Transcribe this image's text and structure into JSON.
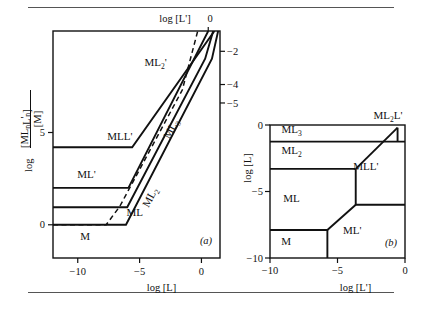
{
  "figure": {
    "panel_a_id": "(a)",
    "panel_b_id": "(b)"
  },
  "chart_data": [
    {
      "type": "line",
      "panel": "(a)",
      "title": "",
      "xlabel": "log [L]",
      "ylabel": "log [ML_nL'_n] / [M]",
      "ylabel_parts": {
        "log": "log",
        "numerator": "[ML",
        "numerator_sub1": "n",
        "numerator_mid": "L",
        "numerator_prime": "'",
        "numerator_sub2": "n",
        "numerator_end": "]",
        "denominator": "[M]"
      },
      "top_axis_label": "log [L']",
      "top_axis_tick": "0",
      "xlim": [
        -12,
        1.5
      ],
      "ylim": [
        -1.8,
        10.5
      ],
      "xticks": [
        -10,
        -5,
        0
      ],
      "xticklabels": [
        "−10",
        "−5",
        "0"
      ],
      "yticks": [
        0,
        5
      ],
      "yticklabels": [
        "0",
        "5"
      ],
      "right_ticks": [
        9.4,
        7.6,
        6.6
      ],
      "right_ticklabels": [
        "−2",
        "−4",
        "−5"
      ],
      "grid": false,
      "legend": "none",
      "region_labels": [
        {
          "text": "ML",
          "prime": "'",
          "x": -9.3,
          "y": 2.55,
          "rotate": 0
        },
        {
          "text": "MLL",
          "prime": "'",
          "x": -6.6,
          "y": 4.6,
          "rotate": 0
        },
        {
          "text": "ML",
          "sub": "2",
          "prime": "'",
          "x": -3.7,
          "y": 8.6,
          "rotate": 0
        },
        {
          "text": "ML",
          "sub": "3",
          "prime": "",
          "x": -2.2,
          "y": 5.1,
          "rotate": -62
        },
        {
          "text": "ML",
          "sub": "2",
          "prime": "",
          "x": -3.9,
          "y": 1.4,
          "rotate": -62
        },
        {
          "text": "ML",
          "prime": "",
          "x": -5.4,
          "y": 0.45,
          "rotate": 0
        },
        {
          "text": "M",
          "prime": "",
          "x": -9.4,
          "y": -0.85,
          "rotate": 0
        }
      ],
      "series": [
        {
          "name": "ML'/MLL' boundary",
          "style": "solid",
          "points": [
            [
              -12,
              2.0
            ],
            [
              -5.9,
              2.0
            ],
            [
              0.55,
              10.5
            ]
          ]
        },
        {
          "name": "MLL'/ML2L' boundary",
          "style": "solid",
          "points": [
            [
              -12,
              4.2
            ],
            [
              -5.6,
              4.2
            ],
            [
              1.05,
              10.5
            ]
          ]
        },
        {
          "name": "ML/ML2 boundary",
          "style": "solid",
          "points": [
            [
              -12,
              0.95
            ],
            [
              -6.0,
              0.95
            ],
            [
              0.3,
              9.0
            ],
            [
              0.95,
              10.5
            ]
          ]
        },
        {
          "name": "M/ML dashed boundary",
          "style": "dashed",
          "points": [
            [
              -12,
              0.0
            ],
            [
              -7.7,
              0.0
            ],
            [
              -6.6,
              1.0
            ],
            [
              -1.55,
              7.3
            ],
            [
              -0.3,
              10.5
            ]
          ]
        },
        {
          "name": "ML2/ML3 boundary",
          "style": "solid",
          "points": [
            [
              -12,
              0.0
            ],
            [
              -6.1,
              0.0
            ],
            [
              0.85,
              9.0
            ],
            [
              1.35,
              10.5
            ]
          ]
        }
      ]
    },
    {
      "type": "line",
      "panel": "(b)",
      "title": "",
      "xlabel": "log [L']",
      "ylabel": "log [L]",
      "xlim": [
        -10,
        0
      ],
      "ylim": [
        -10,
        0
      ],
      "xticks": [
        -10,
        -5,
        0
      ],
      "xticklabels": [
        "−10",
        "−5",
        "0"
      ],
      "yticks": [
        0,
        -5,
        -10
      ],
      "yticklabels": [
        "0",
        "−5",
        "−10"
      ],
      "grid": false,
      "legend": "none",
      "corner_label": "ML2L'",
      "corner_label_parts": {
        "text": "ML",
        "sub": "2",
        "end": "L",
        "prime": "'"
      },
      "region_labels": [
        {
          "text": "ML",
          "sub": "3",
          "prime": "",
          "x": -8.4,
          "y": -0.62,
          "rotate": 0
        },
        {
          "text": "ML",
          "sub": "2",
          "prime": "",
          "x": -8.4,
          "y": -2.2,
          "rotate": 0
        },
        {
          "text": "ML",
          "sub": "",
          "prime": "",
          "x": -8.4,
          "y": -5.8,
          "rotate": 0
        },
        {
          "text": "M",
          "sub": "",
          "prime": "",
          "x": -8.8,
          "y": -9.0,
          "rotate": 0
        },
        {
          "text": "ML",
          "sub": "",
          "prime": "'",
          "x": -3.9,
          "y": -8.2,
          "rotate": 0
        },
        {
          "text": "MLL",
          "sub": "",
          "prime": "'",
          "x": -2.9,
          "y": -3.4,
          "rotate": 0
        }
      ],
      "series": [
        {
          "name": "ML3/ML2 boundary",
          "style": "solid",
          "points": [
            [
              -10,
              -1.25
            ],
            [
              0,
              -1.25
            ]
          ]
        },
        {
          "name": "ML2/ML boundary",
          "style": "solid",
          "points": [
            [
              -10,
              -3.3
            ],
            [
              -3.65,
              -3.3
            ]
          ]
        },
        {
          "name": "MLL'/ML2L' diagonal",
          "style": "solid",
          "points": [
            [
              -3.65,
              -3.3
            ],
            [
              -0.55,
              -0.2
            ]
          ]
        },
        {
          "name": "MLL'/ML' boundary",
          "style": "solid",
          "points": [
            [
              -3.65,
              -3.3
            ],
            [
              -3.65,
              -6.0
            ],
            [
              0,
              -6.0
            ]
          ]
        },
        {
          "name": "ML/ML' diagonal",
          "style": "solid",
          "points": [
            [
              -3.65,
              -6.0
            ],
            [
              -5.75,
              -7.9
            ]
          ]
        },
        {
          "name": "M/ML boundary",
          "style": "solid",
          "points": [
            [
              -10,
              -7.9
            ],
            [
              -5.75,
              -7.9
            ],
            [
              -5.75,
              -10
            ]
          ]
        },
        {
          "name": "ML2L' corner tick",
          "style": "solid",
          "points": [
            [
              -0.55,
              -0.2
            ],
            [
              -0.55,
              -1.25
            ]
          ]
        }
      ]
    }
  ]
}
